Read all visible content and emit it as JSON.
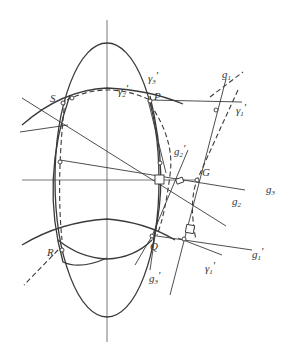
{
  "figure": {
    "type": "geometric construction",
    "points": {
      "S": "S",
      "P": "P",
      "R": "R",
      "Q": "Q",
      "G": "G"
    },
    "curves": {
      "gamma1": {
        "base": "γ",
        "sub": "1",
        "prime": "′"
      },
      "gamma2": {
        "base": "γ",
        "sub": "2",
        "prime": "′"
      },
      "gamma3": {
        "base": "γ",
        "sub": "3",
        "prime": "′"
      },
      "gamma1_lower": {
        "base": "γ",
        "sub": "1",
        "prime": "′"
      }
    },
    "lines": {
      "g1": {
        "base": "g",
        "sub": "1",
        "prime": ""
      },
      "g2": {
        "base": "g",
        "sub": "2",
        "prime": ""
      },
      "g3": {
        "base": "g",
        "sub": "3",
        "prime": ""
      },
      "g1p": {
        "base": "g",
        "sub": "1",
        "prime": "′"
      },
      "g2p": {
        "base": "g",
        "sub": "2",
        "prime": "′"
      },
      "g3p": {
        "base": "g",
        "sub": "3",
        "prime": "′"
      }
    }
  }
}
